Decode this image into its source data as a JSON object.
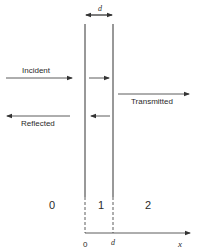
{
  "diagram": {
    "title": "",
    "thickness_label": "d",
    "arrows": {
      "incident": "Incident",
      "transmitted": "Transmitted",
      "reflected": "Reflected"
    },
    "regions": [
      "0",
      "1",
      "2"
    ],
    "axis": {
      "origin_label": "0",
      "d_label": "d",
      "x_label": "x"
    },
    "colors": {
      "line": "#333333",
      "background": "#ffffff"
    }
  }
}
